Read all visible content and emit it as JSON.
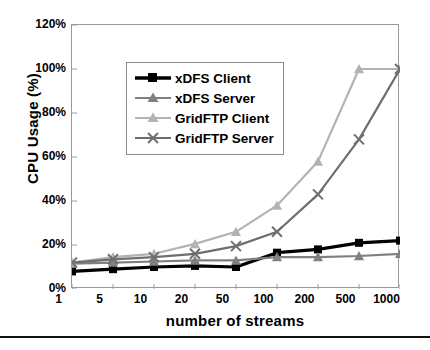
{
  "chart_data": {
    "type": "line",
    "title": "",
    "xlabel": "number of streams",
    "ylabel": "CPU Usage (%)",
    "categories": [
      "1",
      "5",
      "10",
      "20",
      "50",
      "100",
      "200",
      "500",
      "1000"
    ],
    "ylim": [
      0,
      120
    ],
    "yticks": [
      "0%",
      "20%",
      "40%",
      "60%",
      "80%",
      "100%",
      "120%"
    ],
    "ytick_values": [
      0,
      20,
      40,
      60,
      80,
      100,
      120
    ],
    "grid": false,
    "legend_position": "upper-left-inside",
    "series": [
      {
        "name": "xDFS Client",
        "color": "#000000",
        "marker": "square",
        "values": [
          8,
          9,
          10,
          10.5,
          10,
          16.5,
          18,
          21,
          22
        ]
      },
      {
        "name": "xDFS Server",
        "color": "#808080",
        "marker": "triangle",
        "values": [
          11.5,
          12,
          12.5,
          13,
          13,
          14.5,
          14.5,
          15,
          16
        ]
      },
      {
        "name": "GridFTP Client",
        "color": "#b3b3b3",
        "marker": "triangle",
        "values": [
          12,
          14.5,
          16,
          20.5,
          26,
          38,
          58,
          100,
          100
        ]
      },
      {
        "name": "GridFTP Server",
        "color": "#6e6e6e",
        "marker": "x",
        "values": [
          12,
          13.5,
          14.5,
          16,
          19.5,
          26,
          43,
          68,
          100
        ]
      }
    ]
  },
  "axis": {
    "ylabel_text": "CPU Usage (%)",
    "xlabel_text": "number of streams"
  }
}
